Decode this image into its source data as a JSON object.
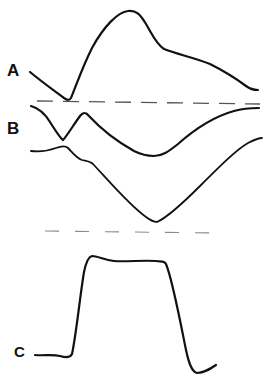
{
  "figure": {
    "traces": [
      {
        "label": "A",
        "shape": "dip below baseline followed by large peak and slow decay"
      },
      {
        "label": "B",
        "shape": "pair of curves: upper with notch then broad trough recovering upward; lower with small bump then deep trough"
      },
      {
        "label": "C",
        "shape": "rectangular plateau pulse with undershoot"
      }
    ],
    "colors": {
      "stroke": "#111111",
      "baseline": "#555555",
      "background": "#ffffff"
    }
  }
}
